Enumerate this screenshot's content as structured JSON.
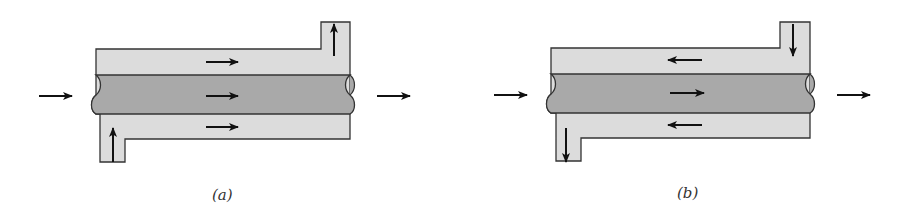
{
  "figure": {
    "colors": {
      "shell_fill": "#dcdcdc",
      "tube_fill": "#a9a9a9",
      "outline": "#333333",
      "arrow": "#111111",
      "background": "#ffffff"
    },
    "panels": [
      {
        "id": "a",
        "caption": "(a)",
        "arrangement": "parallel-flow",
        "tube_flow": "left-to-right",
        "annulus_flow": "left-to-right",
        "annulus_inlet": "bottom-left nozzle (upward)",
        "annulus_outlet": "top-right nozzle (upward)"
      },
      {
        "id": "b",
        "caption": "(b)",
        "arrangement": "counterflow",
        "tube_flow": "left-to-right",
        "annulus_flow": "right-to-left",
        "annulus_inlet": "top-right nozzle (downward)",
        "annulus_outlet": "bottom-left nozzle (downward)"
      }
    ]
  }
}
